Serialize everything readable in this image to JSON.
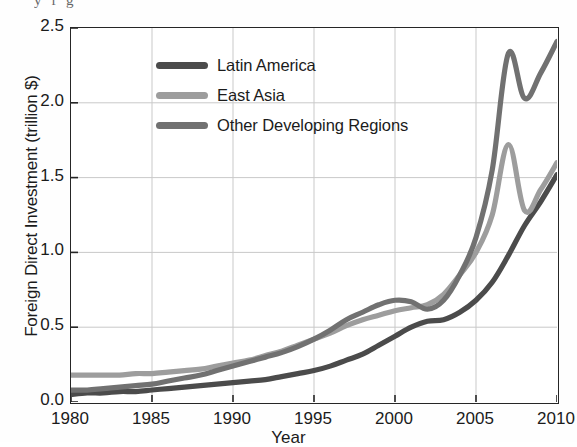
{
  "figure": {
    "cropped_header_text": "y            f       g",
    "axis_color": "#262626",
    "grid_color": "#c9c9c9",
    "background": "#ffffff"
  },
  "legend": {
    "position": "upper-left-inside",
    "entries": [
      {
        "label": "Latin America",
        "color": "#4b4b4b"
      },
      {
        "label": "East Asia",
        "color": "#9d9d9d"
      },
      {
        "label": "Other Developing Regions",
        "color": "#717171"
      }
    ]
  },
  "axes": {
    "y_label": "Foreign Direct Investment (trillion $)",
    "x_label": "Year",
    "y_ticks": [
      "0.0",
      "0.5",
      "1.0",
      "1.5",
      "2.0",
      "2.5"
    ],
    "x_ticks": [
      "1980",
      "1985",
      "1990",
      "1995",
      "2000",
      "2005",
      "2010"
    ]
  },
  "chart_data": {
    "type": "line",
    "title": "",
    "xlabel": "Year",
    "ylabel": "Foreign Direct Investment (trillion $)",
    "xlim": [
      1980,
      2010
    ],
    "ylim": [
      0.0,
      2.5
    ],
    "ytick_values": [
      0.0,
      0.5,
      1.0,
      1.5,
      2.0,
      2.5
    ],
    "xtick_values": [
      1980,
      1985,
      1990,
      1995,
      2000,
      2005,
      2010
    ],
    "grid": true,
    "legend_position": "upper left",
    "x": [
      1980,
      1981,
      1982,
      1983,
      1984,
      1985,
      1986,
      1987,
      1988,
      1989,
      1990,
      1991,
      1992,
      1993,
      1994,
      1995,
      1996,
      1997,
      1998,
      1999,
      2000,
      2001,
      2002,
      2003,
      2004,
      2005,
      2006,
      2007,
      2008,
      2009,
      2010
    ],
    "series": [
      {
        "name": "Latin America",
        "color": "#4b4b4b",
        "values": [
          0.05,
          0.06,
          0.06,
          0.07,
          0.07,
          0.08,
          0.09,
          0.1,
          0.11,
          0.12,
          0.13,
          0.14,
          0.15,
          0.17,
          0.19,
          0.21,
          0.24,
          0.28,
          0.32,
          0.38,
          0.44,
          0.5,
          0.54,
          0.55,
          0.6,
          0.68,
          0.8,
          0.98,
          1.18,
          1.34,
          1.52
        ]
      },
      {
        "name": "East Asia",
        "color": "#9d9d9d",
        "values": [
          0.18,
          0.18,
          0.18,
          0.18,
          0.19,
          0.19,
          0.2,
          0.21,
          0.22,
          0.24,
          0.26,
          0.28,
          0.31,
          0.34,
          0.38,
          0.42,
          0.46,
          0.51,
          0.55,
          0.58,
          0.61,
          0.63,
          0.65,
          0.72,
          0.85,
          1.0,
          1.25,
          1.72,
          1.28,
          1.42,
          1.6
        ]
      },
      {
        "name": "Other Developing Regions",
        "color": "#717171",
        "values": [
          0.08,
          0.08,
          0.09,
          0.1,
          0.11,
          0.12,
          0.14,
          0.16,
          0.18,
          0.21,
          0.24,
          0.27,
          0.3,
          0.33,
          0.37,
          0.42,
          0.48,
          0.55,
          0.6,
          0.65,
          0.68,
          0.67,
          0.62,
          0.68,
          0.85,
          1.1,
          1.55,
          2.33,
          2.03,
          2.2,
          2.41
        ]
      }
    ]
  }
}
